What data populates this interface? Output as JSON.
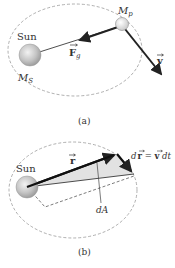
{
  "panel_a": {
    "caption": "(a)",
    "sun_label": "Sun",
    "sun_mass_label": "M",
    "sun_mass_sub": "S",
    "planet_mass_label": "M",
    "planet_mass_sub": "p",
    "force_label": "F",
    "force_sub": "g",
    "velocity_label": "v"
  },
  "panel_b": {
    "caption": "(b)",
    "sun_label": "Sun",
    "position_label": "r",
    "displacement_label_d": "d",
    "displacement_label_r": "r",
    "displacement_eq": " = ",
    "displacement_label_v": "v",
    "displacement_label_dt": " dt",
    "area_label": "dA"
  },
  "colors": {
    "orbit": "#9a9a9a",
    "vector": "#222222",
    "area_fill": "#e2e2e2",
    "sun_fill": "#b8b8b8",
    "text": "#333333"
  }
}
